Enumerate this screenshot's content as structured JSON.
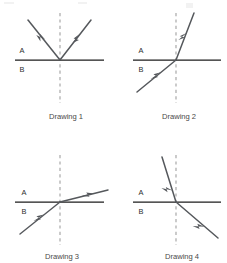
{
  "figure": {
    "background_color": "#ffffff",
    "ray_color": "#55585c",
    "interface_color": "#1c1c1c",
    "normal_color": "#9c9c9c",
    "label_color": "#2e2e2e",
    "caption_color": "#4a4a4a"
  },
  "panels": [
    {
      "id": "drawing-1",
      "caption": "Drawing 1",
      "upper_medium": "A",
      "lower_medium": "B",
      "phenomenon": "reflection",
      "rays": [
        {
          "name": "incident-ray",
          "from_region": "A",
          "direction": "down-right",
          "angle_from_horizontal_deg": 47
        },
        {
          "name": "reflected-ray",
          "from_region": "A",
          "direction": "up-right",
          "angle_from_horizontal_deg": 47
        }
      ]
    },
    {
      "id": "drawing-2",
      "caption": "Drawing 2",
      "upper_medium": "A",
      "lower_medium": "B",
      "phenomenon": "refraction",
      "rays": [
        {
          "name": "incident-ray",
          "from_region": "B",
          "direction": "up-right",
          "angle_from_horizontal_deg": 30
        },
        {
          "name": "refracted-ray",
          "from_region": "A",
          "direction": "up-right",
          "angle_from_horizontal_deg": 70
        }
      ]
    },
    {
      "id": "drawing-3",
      "caption": "Drawing 3",
      "upper_medium": "A",
      "lower_medium": "B",
      "phenomenon": "refraction",
      "rays": [
        {
          "name": "incident-ray",
          "from_region": "B",
          "direction": "up-right",
          "angle_from_horizontal_deg": 30
        },
        {
          "name": "refracted-ray",
          "from_region": "A",
          "direction": "up-right",
          "angle_from_horizontal_deg": 13
        }
      ]
    },
    {
      "id": "drawing-4",
      "caption": "Drawing 4",
      "upper_medium": "A",
      "lower_medium": "B",
      "phenomenon": "refraction",
      "rays": [
        {
          "name": "incident-ray",
          "from_region": "A",
          "direction": "down-right",
          "angle_from_horizontal_deg": 72
        },
        {
          "name": "refracted-ray",
          "from_region": "B",
          "direction": "down-right",
          "angle_from_horizontal_deg": 28
        }
      ]
    }
  ]
}
